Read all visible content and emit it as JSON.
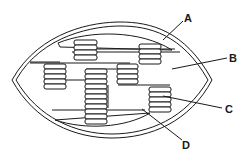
{
  "diagram": {
    "labels": [
      {
        "id": "A",
        "text": "A",
        "points_to": "membrane"
      },
      {
        "id": "B",
        "text": "B",
        "points_to": "stroma"
      },
      {
        "id": "C",
        "text": "C",
        "points_to": "thylakoid stack (granum)"
      },
      {
        "id": "D",
        "text": "D",
        "points_to": "lamella"
      }
    ],
    "colors": {
      "line": "#1a1a1a",
      "background": "#ffffff"
    }
  }
}
